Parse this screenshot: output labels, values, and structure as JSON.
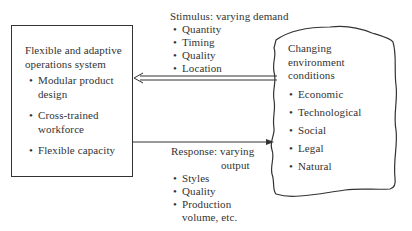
{
  "left_box": {
    "title_line1": "Flexible and adaptive",
    "title_line2": "operations system",
    "items": [
      {
        "line1": "Modular product",
        "line2": "design"
      },
      {
        "line1": "Cross-trained",
        "line2": "workforce"
      },
      {
        "line1": "Flexible capacity",
        "line2": ""
      }
    ]
  },
  "right_cloud": {
    "title_line1": "Changing",
    "title_line2": "environment",
    "title_line3": "conditions",
    "items": [
      "Economic",
      "Technological",
      "Social",
      "Legal",
      "Natural"
    ]
  },
  "stimulus": {
    "label": "Stimulus: varying demand",
    "items": [
      "Quantity",
      "Timing",
      "Quality",
      "Location"
    ]
  },
  "response": {
    "label_line1": "Response: varying",
    "label_line2": "output",
    "items": [
      {
        "line1": "Styles",
        "line2": ""
      },
      {
        "line1": "Quality",
        "line2": ""
      },
      {
        "line1": "Production",
        "line2": "volume, etc."
      }
    ]
  },
  "colors": {
    "ink": "#333333",
    "background": "#ffffff"
  }
}
